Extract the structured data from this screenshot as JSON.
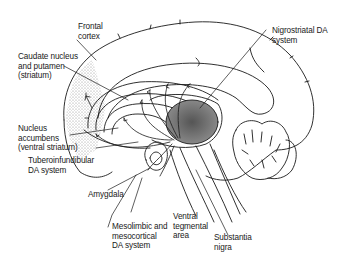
{
  "diagram": {
    "colors": {
      "ink": "#1a1a1a",
      "stipple": "#9a9a9a",
      "background": "#ffffff"
    },
    "labels": {
      "frontal_cortex": "Frontal\ncortex",
      "caudate_putamen": "Caudate nucleus\nand putamen\n(striatum)",
      "nucleus_accumbens": "Nucleus\naccumbens\n(ventral striatum)",
      "tuberoinfundibular": "Tuberoinfundibular\nDA system",
      "amygdala": "Amygdala",
      "mesolimbic": "Mesolimbic and\nmesocortical\nDA system",
      "ventral_tegmental": "Ventral\ntegmental\narea",
      "substantia_nigra": "Substantia\nnigra",
      "nigrostriatal": "Nigrostriatal DA\nsystem"
    }
  }
}
